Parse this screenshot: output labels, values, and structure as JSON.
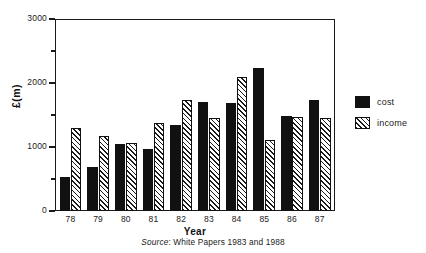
{
  "chart_data": {
    "type": "bar",
    "title": "",
    "subtitle": "",
    "xlabel": "Year",
    "ylabel": "£(m)",
    "ylim": [
      0,
      3000
    ],
    "yticks": [
      0,
      500,
      1000,
      1500,
      2000,
      2500,
      3000
    ],
    "ytick_labels": [
      "0",
      "",
      "1000",
      "",
      "2000",
      "",
      "3000"
    ],
    "grid": false,
    "legend_position": "right",
    "categories": [
      "78",
      "79",
      "80",
      "81",
      "82",
      "83",
      "84",
      "85",
      "86",
      "87"
    ],
    "series": [
      {
        "name": "cost",
        "color": "#111111",
        "fill": "solid",
        "values": [
          530,
          680,
          1040,
          970,
          1350,
          1710,
          1680,
          2230,
          1480,
          1740
        ]
      },
      {
        "name": "income",
        "color": "#1a1a1a",
        "fill": "diagonal-hatch",
        "values": [
          1290,
          1170,
          1070,
          1380,
          1740,
          1450,
          2090,
          1110,
          1470,
          1450
        ]
      }
    ],
    "source": {
      "prefix": "Source",
      "text": ": White Papers 1983 and 1988",
      "full": "Source: White Papers 1983 and 1988"
    }
  },
  "legend": {
    "items": [
      {
        "label": "cost"
      },
      {
        "label": "income"
      }
    ]
  }
}
